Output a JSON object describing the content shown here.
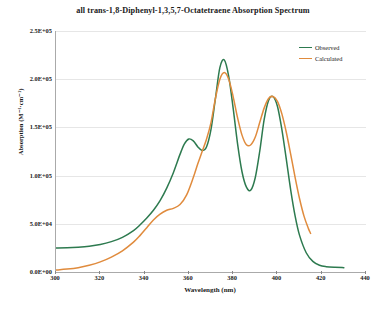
{
  "chart_data": {
    "type": "line",
    "title": "all trans-1,8-Diphenyl-1,3,5,7-Octatetraene Absorption Spectrum",
    "xlabel": "Wavelength (nm)",
    "ylabel": "Absorption (M⁻¹·cm⁻¹)",
    "xlim": [
      300,
      440
    ],
    "ylim": [
      0,
      250000
    ],
    "xticks": [
      300,
      320,
      340,
      360,
      380,
      400,
      420,
      440
    ],
    "xtick_labels": [
      "300",
      "320",
      "340",
      "360",
      "380",
      "400",
      "420",
      "440"
    ],
    "yticks": [
      0,
      50000,
      100000,
      150000,
      200000,
      250000
    ],
    "ytick_labels": [
      "0.0E+00",
      "5.0E+04",
      "1.0E+05",
      "1.5E+05",
      "2.0E+05",
      "2.5E+05"
    ],
    "grid": "horizontal",
    "legend_position": "top-right-inside",
    "series": [
      {
        "name": "Observed",
        "color": "#2d7a4f",
        "x": [
          300,
          305,
          310,
          315,
          320,
          325,
          330,
          335,
          338,
          341,
          344,
          347,
          350,
          353,
          356,
          358,
          360,
          362,
          364,
          366,
          368,
          370,
          372,
          374,
          376,
          378,
          380,
          382,
          384,
          386,
          388,
          390,
          392,
          394,
          396,
          398,
          400,
          402,
          404,
          406,
          408,
          410,
          413,
          416,
          419,
          422,
          426,
          430
        ],
        "y": [
          25000,
          25200,
          25800,
          26800,
          28500,
          31500,
          36000,
          43000,
          49000,
          56000,
          64000,
          74000,
          87000,
          103000,
          122000,
          133000,
          138000,
          136000,
          130000,
          126000,
          130000,
          148000,
          180000,
          212000,
          220000,
          203000,
          170000,
          133000,
          104000,
          88000,
          85000,
          98000,
          125000,
          158000,
          178000,
          182000,
          172000,
          148000,
          117000,
          85000,
          58000,
          38000,
          20000,
          11000,
          7000,
          5500,
          4800,
          4500
        ]
      },
      {
        "name": "Calculated",
        "color": "#e08b3d",
        "x": [
          300,
          305,
          310,
          315,
          320,
          325,
          330,
          335,
          338,
          341,
          344,
          347,
          350,
          353,
          356,
          359,
          362,
          364,
          366,
          368,
          370,
          372,
          374,
          376,
          378,
          380,
          382,
          384,
          386,
          388,
          390,
          392,
          394,
          396,
          398,
          400,
          402,
          404,
          406,
          408,
          410,
          412,
          414,
          415
        ],
        "y": [
          2000,
          3000,
          4500,
          7000,
          10500,
          15500,
          22000,
          31000,
          38000,
          46000,
          54000,
          60000,
          64000,
          66000,
          70000,
          80000,
          98000,
          112000,
          125000,
          138000,
          155000,
          180000,
          200000,
          207000,
          200000,
          182000,
          160000,
          142000,
          132000,
          132000,
          140000,
          155000,
          170000,
          180000,
          182000,
          177000,
          164000,
          145000,
          122000,
          98000,
          76000,
          58000,
          45000,
          40000
        ]
      }
    ]
  }
}
